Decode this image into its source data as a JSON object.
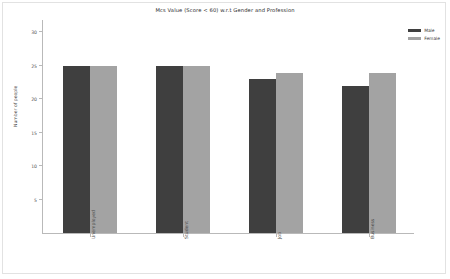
{
  "chart_data": {
    "type": "bar",
    "title": "Mcs Value (Score < 60) w.r.t Gender and Profession",
    "xlabel": "",
    "ylabel": "Number of people",
    "categories": [
      "Unemployed",
      "Student",
      "Job",
      "Business"
    ],
    "series": [
      {
        "name": "Male",
        "color": "#3f3f3f",
        "values": [
          25,
          25,
          23,
          22
        ]
      },
      {
        "name": "Female",
        "color": "#a3a3a3",
        "values": [
          25,
          25,
          24,
          24
        ]
      }
    ],
    "ylim": [
      0,
      32
    ],
    "yticks": [
      5,
      10,
      15,
      20,
      25,
      30
    ],
    "ytick_labels": [
      "5",
      "10",
      "15",
      "20",
      "25",
      "30"
    ],
    "grid": false,
    "legend_position": "upper right"
  },
  "legend": {
    "entries": [
      {
        "label": "Male"
      },
      {
        "label": "Female"
      }
    ]
  }
}
